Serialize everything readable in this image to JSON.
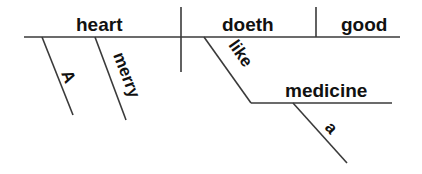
{
  "diagram": {
    "type": "sentence-diagram (Reed-Kellogg)",
    "sentence_words": [
      "A",
      "merry",
      "heart",
      "doeth",
      "good",
      "like",
      "a",
      "medicine"
    ],
    "subject": "heart",
    "verb": "doeth",
    "complement": "good",
    "modifiers": {
      "article": "A",
      "adjective": "merry",
      "preposition": "like",
      "object_of_preposition": "medicine",
      "object_article": "a"
    },
    "colors": {
      "line": "#3a3a3a",
      "text": "#111111",
      "background": "#ffffff"
    }
  }
}
